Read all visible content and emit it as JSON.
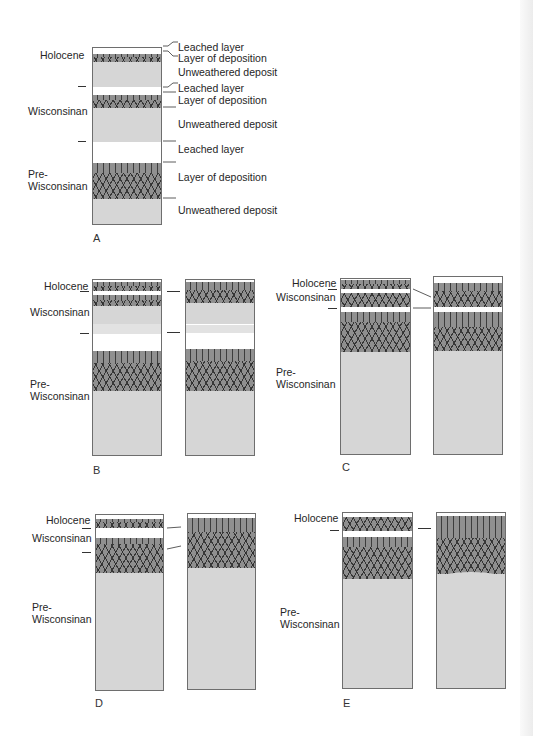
{
  "figure": {
    "panels": [
      {
        "id": "A",
        "label": "A"
      },
      {
        "id": "B",
        "label": "B"
      },
      {
        "id": "C",
        "label": "C"
      },
      {
        "id": "D",
        "label": "D"
      },
      {
        "id": "E",
        "label": "E"
      }
    ],
    "stage_labels": {
      "holocene": "Holocene",
      "wisconsinan": "Wisconsinan",
      "pre_wisconsinan_1": "Pre-",
      "pre_wisconsinan_2": "Wisconsinan"
    },
    "layer_labels": [
      "Leached layer",
      "Layer of deposition",
      "Unweathered deposit",
      "Leached layer",
      "Layer of deposition",
      "Unweathered deposit",
      "Leached layer",
      "Layer of deposition",
      "Unweathered deposit"
    ],
    "colors": {
      "leached": "#ffffff",
      "deposition": "#8f8f8f",
      "unweathered": "#d6d6d6",
      "outline": "#6e6e6e"
    }
  }
}
